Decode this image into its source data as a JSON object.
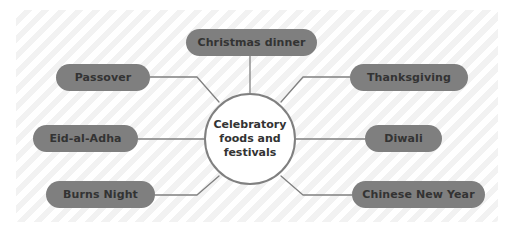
{
  "diagram": {
    "type": "mind-map",
    "title": "Celebratory foods and festivals",
    "center": {
      "label": "Celebratory foods and festivals",
      "shape": "circle",
      "fill": "#ffffff",
      "stroke": "#808080",
      "text_color": "#333333"
    },
    "style": {
      "panel_background": "#fbfbfb",
      "panel_stripe": "#f2f2f2",
      "node_fill": "#7f7f7f",
      "node_text": "#333333",
      "connector": "#808080"
    },
    "branches": [
      {
        "id": "christmas-dinner",
        "label": "Christmas dinner",
        "position": "top"
      },
      {
        "id": "passover",
        "label": "Passover",
        "position": "left-top"
      },
      {
        "id": "eid-al-adha",
        "label": "Eid-al-Adha",
        "position": "left-middle"
      },
      {
        "id": "burns-night",
        "label": "Burns Night",
        "position": "left-bottom"
      },
      {
        "id": "thanksgiving",
        "label": "Thanksgiving",
        "position": "right-top"
      },
      {
        "id": "diwali",
        "label": "Diwali",
        "position": "right-middle"
      },
      {
        "id": "chinese-new-year",
        "label": "Chinese New Year",
        "position": "right-bottom"
      }
    ]
  }
}
